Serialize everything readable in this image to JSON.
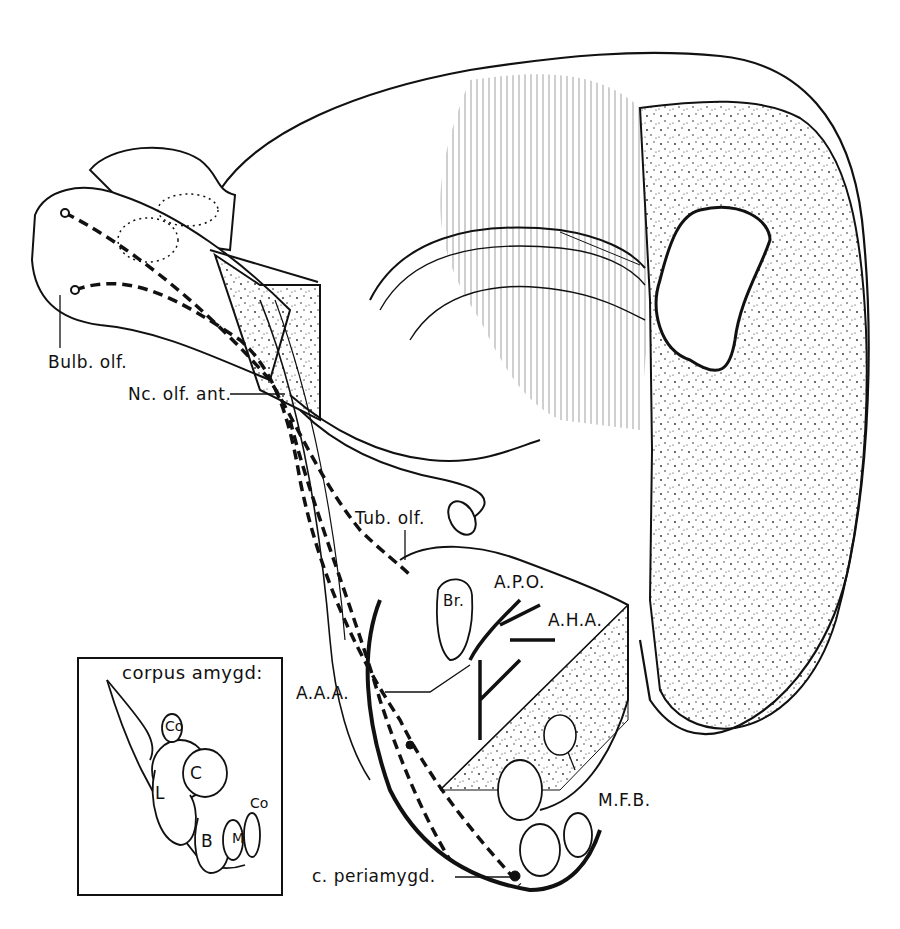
{
  "figure": {
    "colors": {
      "ink": "#111111",
      "paper": "#ffffff"
    }
  },
  "labels": {
    "bulb_olf": "Bulb. olf.",
    "nc_olf_ant": "Nc. olf. ant.",
    "tub_olf": "Tub. olf.",
    "apo": "A.P.O.",
    "aha": "A.H.A.",
    "aaa": "A.A.A.",
    "br": "Br.",
    "mfb": "M.F.B.",
    "c_periamygd": "c. periamygd."
  },
  "inset": {
    "title": "corpus amygd:",
    "nuclei": {
      "co_top": "Co",
      "c": "C",
      "l": "L",
      "b": "B",
      "m": "M",
      "co_right": "Co"
    }
  }
}
